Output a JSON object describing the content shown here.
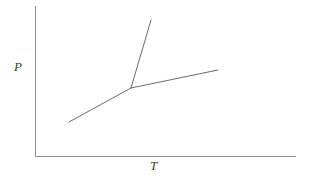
{
  "chart_data": {
    "type": "line",
    "title": "",
    "subtitle": "",
    "xlabel": "T",
    "ylabel": "P",
    "grid": false,
    "legend": false,
    "axis_style": "open-corner-L",
    "xlim": [
      0,
      1
    ],
    "ylim": [
      0,
      1
    ],
    "xticks": [],
    "yticks": [],
    "xticklabels": [],
    "yticklabels": [],
    "annotations": [],
    "series": [
      {
        "name": "sublimation-curve",
        "points": [
          [
            69,
            122
          ],
          [
            131,
            88
          ]
        ],
        "color": "#5a5a5a",
        "width": 0.9
      },
      {
        "name": "fusion-curve",
        "points": [
          [
            131,
            88
          ],
          [
            151,
            20
          ]
        ],
        "color": "#5a5a5a",
        "width": 0.9
      },
      {
        "name": "vaporization-curve",
        "points": [
          [
            131,
            88
          ],
          [
            218,
            70
          ]
        ],
        "color": "#5a5a5a",
        "width": 0.9
      }
    ],
    "axes": {
      "y_axis": {
        "x": 35,
        "y_top": 6,
        "y_bottom": 156,
        "color": "#8f8f8f",
        "width": 1
      },
      "x_axis": {
        "y": 156,
        "x_left": 35,
        "x_right": 296,
        "color": "#8f8f8f",
        "width": 1
      }
    },
    "triple_point": [
      131,
      88
    ]
  },
  "labels": {
    "y_axis_label": "P",
    "x_axis_label": "T"
  }
}
